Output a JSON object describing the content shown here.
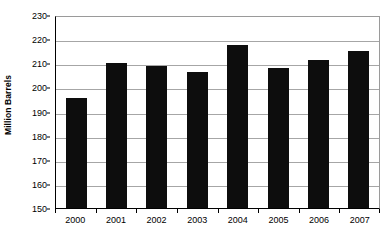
{
  "chart_data": {
    "type": "bar",
    "title": "",
    "xlabel": "",
    "ylabel": "Million Barrels",
    "categories": [
      "2000",
      "2001",
      "2002",
      "2003",
      "2004",
      "2005",
      "2006",
      "2007"
    ],
    "values": [
      195.5,
      210.0,
      209.0,
      206.5,
      217.5,
      208.0,
      211.5,
      215.0
    ],
    "ylim": [
      150,
      230
    ],
    "ytick_labels": [
      "150",
      "160",
      "170",
      "180",
      "190",
      "200",
      "210",
      "220",
      "230"
    ],
    "ytick_values": [
      150,
      160,
      170,
      180,
      190,
      200,
      210,
      220,
      230
    ],
    "grid": true,
    "legend": false,
    "bar_color": "#0d0d0d",
    "gridline_color": "#a6a6a6",
    "axis_color": "#000000",
    "background_color": "#ffffff"
  }
}
